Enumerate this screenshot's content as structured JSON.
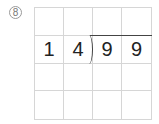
{
  "problem": {
    "number_label": "⑧",
    "divisor": [
      "1",
      "4"
    ],
    "dividend": [
      "9",
      "9"
    ]
  },
  "grid": {
    "rows": 4,
    "cols": 4,
    "cells": [
      [
        "",
        "",
        "",
        ""
      ],
      [
        "1",
        "4",
        "9",
        "9"
      ],
      [
        "",
        "",
        "",
        ""
      ],
      [
        "",
        "",
        "",
        ""
      ]
    ]
  },
  "colors": {
    "grid_line": "#d6d6d6",
    "digit": "#222222",
    "bracket": "#444444"
  }
}
